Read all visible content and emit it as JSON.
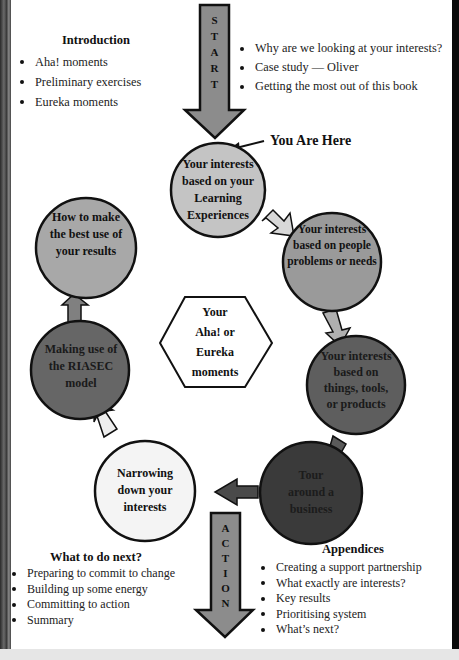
{
  "diagram": {
    "start_arrow": {
      "letters": [
        "S",
        "T",
        "A",
        "R",
        "T"
      ],
      "color": "#8c8c8c"
    },
    "action_arrow": {
      "letters": [
        "A",
        "C",
        "T",
        "I",
        "O",
        "N"
      ],
      "color": "#8c8c8c"
    },
    "you_are_here": "You Are Here",
    "center": {
      "lines": [
        "Your",
        "Aha! or",
        "Eureka",
        "moments"
      ]
    },
    "nodes": [
      {
        "id": "learning",
        "lines": [
          "Your interests",
          "based on your",
          "Learning",
          "Experiences"
        ],
        "fill": "#c4c4c4",
        "text_color": "#111111"
      },
      {
        "id": "people",
        "lines": [
          "Your interests",
          "based on people",
          "problems or needs"
        ],
        "fill": "#9a9a9a",
        "text_color": "#111111"
      },
      {
        "id": "things",
        "lines": [
          "Your interests",
          "based on",
          "things, tools,",
          "or products"
        ],
        "fill": "#5e5e5e",
        "text_color": "#1a1a1a"
      },
      {
        "id": "tour",
        "lines": [
          "Tour",
          "around a",
          "business"
        ],
        "fill": "#3a3a3a",
        "text_color": "#1c1c1c"
      },
      {
        "id": "narrowing",
        "lines": [
          "Narrowing",
          "down your",
          "interests"
        ],
        "fill": "#f4f4f4",
        "text_color": "#111111"
      },
      {
        "id": "riasec",
        "lines": [
          "Making use of",
          "the RIASEC",
          "model"
        ],
        "fill": "#666666",
        "text_color": "#1a1a1a"
      },
      {
        "id": "best-use",
        "lines": [
          "How to make",
          "the best use of",
          "your results"
        ],
        "fill": "#a8a8a8",
        "text_color": "#111111"
      }
    ]
  },
  "sections": {
    "introduction": {
      "title": "Introduction",
      "items": [
        "Aha! moments",
        "Preliminary exercises",
        "Eureka moments"
      ]
    },
    "start_topics": {
      "items": [
        "Why are we looking at your interests?",
        "Case study — Oliver",
        "Getting the most out of this book"
      ]
    },
    "what_next": {
      "title": "What to do next?",
      "items": [
        "Preparing to commit to change",
        "Building up some energy",
        "Committing to action",
        "Summary"
      ]
    },
    "appendices": {
      "title": "Appendices",
      "items": [
        "Creating a support partnership",
        "What exactly are interests?",
        "Key results",
        "Prioritising system",
        "What’s next?"
      ]
    }
  }
}
